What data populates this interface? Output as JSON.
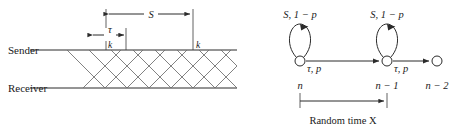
{
  "figure": {
    "left_panel": {
      "name": "sender-receiver-timing-diagram",
      "row_labels": {
        "sender": "Sender",
        "receiver": "Receiver"
      },
      "dimensions": [
        {
          "id": "S",
          "label": "S",
          "x_start": 106,
          "x_end": 193,
          "y": 13
        },
        {
          "id": "tau",
          "label": "τ",
          "x_start": 91,
          "x_end": 126,
          "y": 34
        }
      ],
      "segment_labels": [
        {
          "id": "k-left",
          "label": "k",
          "x": 108,
          "y": 47
        },
        {
          "id": "k-right",
          "label": "k",
          "x": 196,
          "y": 47
        }
      ],
      "lines": {
        "sender_y": 50,
        "receiver_y": 88,
        "x_start": 30,
        "x_end": 237
      }
    },
    "right_panel": {
      "name": "markov-chain-state-diagram",
      "nodes": [
        {
          "id": "n",
          "label": "n",
          "cx": 300,
          "cy": 61,
          "r": 5,
          "has_self_loop": true
        },
        {
          "id": "n-1",
          "label": "n − 1",
          "cx": 387,
          "cy": 61,
          "r": 5,
          "has_self_loop": true
        },
        {
          "id": "n-2",
          "label": "n − 2",
          "cx": 437,
          "cy": 61,
          "r": 5,
          "has_self_loop": false
        }
      ],
      "self_loop_labels": [
        {
          "for": "n",
          "above": "S, 1 − p",
          "below": "τ, p"
        },
        {
          "for": "n-1",
          "above": "S, 1 − p",
          "below": "τ, p"
        }
      ],
      "transitions": [
        {
          "from": "n",
          "to": "n-1"
        },
        {
          "from": "n-1",
          "to": "n-2"
        }
      ],
      "measurement": {
        "label": "Random time X",
        "x_start": 300,
        "x_end": 387,
        "y": 101
      }
    },
    "colors": {
      "ink": "#2b2b2b",
      "hatch": "#6b6b6b",
      "background": "#ffffff"
    }
  }
}
